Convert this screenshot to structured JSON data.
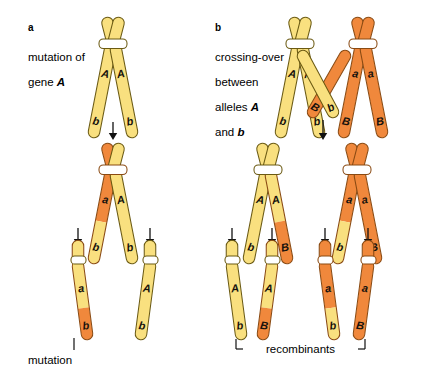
{
  "figure": {
    "background": "#ffffff",
    "colors": {
      "yellow": "#f9e07f",
      "yellow_dark": "#f5d661",
      "orange": "#f0883c",
      "orange_dark": "#e9762a",
      "outline_yellow": "#6b5a12",
      "outline_orange": "#8a4a12",
      "centromere": "#ffffff",
      "text": "#000000",
      "glyph": "#17120c"
    }
  },
  "panel_a": {
    "letter": "a",
    "caption_line1": "mutation of",
    "caption_line2_pre": "gene ",
    "caption_line2_em": "A",
    "annotation": "mutation",
    "stages": {
      "top": {
        "name": "parent-chromosome",
        "chromatids": [
          {
            "upper_label": "A",
            "lower_label": "b",
            "upper_color": "yellow",
            "lower_color": "yellow"
          },
          {
            "upper_label": "A",
            "lower_label": "b",
            "upper_color": "yellow",
            "lower_color": "yellow"
          }
        ]
      },
      "middle": {
        "name": "mutated-chromosome",
        "chromatids": [
          {
            "upper_label": "a",
            "lower_label": "b",
            "upper_color": "orange",
            "lower_color": "yellow"
          },
          {
            "upper_label": "A",
            "lower_label": "b",
            "upper_color": "yellow",
            "lower_color": "yellow"
          }
        ]
      },
      "bottom": [
        {
          "name": "daughter-chromosome-mutant",
          "upper_label": "a",
          "lower_label": "b",
          "upper_color": "yellow",
          "lower_color": "orange"
        },
        {
          "name": "daughter-chromosome-normal",
          "upper_label": "A",
          "lower_label": "b",
          "upper_color": "yellow",
          "lower_color": "yellow"
        }
      ]
    }
  },
  "panel_b": {
    "letter": "b",
    "caption_line1": "crossing-over",
    "caption_line2": "between",
    "caption_line3_pre": "alleles ",
    "caption_line3_em": "A",
    "caption_line4_pre": "and ",
    "caption_line4_em": "b",
    "annotation": "recombinants",
    "stages": {
      "top": [
        {
          "name": "homolog-left",
          "chromatids": [
            {
              "upper_label": "A",
              "lower_label": "b",
              "upper_color": "yellow",
              "lower_color": "yellow"
            },
            {
              "upper_label": "A",
              "lower_label": "b",
              "upper_color": "yellow",
              "lower_color": "yellow"
            }
          ]
        },
        {
          "name": "homolog-right",
          "chromatids": [
            {
              "upper_label": "a",
              "lower_label": "B",
              "upper_color": "orange",
              "lower_color": "orange"
            },
            {
              "upper_label": "a",
              "lower_label": "B",
              "upper_color": "orange",
              "lower_color": "orange"
            }
          ]
        }
      ],
      "crossover_labels": {
        "orange_arm": "B",
        "yellow_arm": "b"
      },
      "middle": [
        {
          "name": "recombined-chromosome-left",
          "chromatids": [
            {
              "upper_label": "A",
              "lower_label": "b",
              "upper_color": "yellow",
              "lower_color": "yellow"
            },
            {
              "upper_label": "A",
              "lower_label": "B",
              "upper_color": "yellow",
              "lower_color": "orange"
            }
          ]
        },
        {
          "name": "recombined-chromosome-right",
          "chromatids": [
            {
              "upper_label": "a",
              "lower_label": "b",
              "upper_color": "orange",
              "lower_color": "yellow"
            },
            {
              "upper_label": "a",
              "lower_label": "B",
              "upper_color": "orange",
              "lower_color": "orange"
            }
          ]
        }
      ],
      "bottom": [
        {
          "name": "gamete-parental-Ab",
          "upper_label": "A",
          "lower_label": "b",
          "upper_color": "yellow",
          "lower_color": "yellow",
          "recombinant": false
        },
        {
          "name": "gamete-recombinant-AB",
          "upper_label": "A",
          "lower_label": "B",
          "upper_color": "yellow",
          "lower_color": "orange",
          "recombinant": true
        },
        {
          "name": "gamete-recombinant-ab",
          "upper_label": "a",
          "lower_label": "b",
          "upper_color": "orange",
          "lower_color": "yellow",
          "recombinant": true
        },
        {
          "name": "gamete-parental-aB",
          "upper_label": "a",
          "lower_label": "B",
          "upper_color": "orange",
          "lower_color": "orange",
          "recombinant": false
        }
      ]
    }
  }
}
